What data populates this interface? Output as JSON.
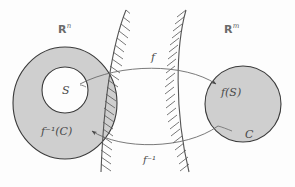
{
  "figure": {
    "background_color": "#fdfdfd"
  },
  "colors": {
    "region_fill": "#cfcfcf",
    "region_stroke": "#3a3a3a",
    "hatch_stroke": "#5a5a5a",
    "arrow_stroke": "#6b6b6b",
    "label_color": "#4a4a4a",
    "space_label_color": "#6a6a6a",
    "inner_hole_fill": "#ffffff"
  },
  "labels": {
    "domain_space": {
      "symbol": "R",
      "superscript": "n",
      "text": "ℝⁿ"
    },
    "codomain_space": {
      "symbol": "R",
      "superscript": "m",
      "text": "ℝᵐ"
    },
    "set_s": "S",
    "set_c": "C",
    "image_of_s": {
      "base": "f",
      "arg": "(S)",
      "text": "f(S)"
    },
    "preimage_of_c": {
      "base": "f",
      "superscript": "−1",
      "arg": "(C)",
      "text": "f⁻¹(C)"
    },
    "map_forward": "f",
    "map_inverse": {
      "base": "f",
      "superscript": "−1",
      "text": "f⁻¹"
    }
  },
  "elements": {
    "left_annulus": {
      "name": "left region annulus",
      "outer_radius": 52,
      "inner_radius": 23,
      "center": [
        65,
        103
      ],
      "fill": "#cfcfcf",
      "description": "shaded annulus representing f inverse of C inside R^n"
    },
    "left_hole": {
      "name": "inner white disc labelled S",
      "radius": 23,
      "center": [
        65,
        90
      ],
      "fill": "#ffffff"
    },
    "right_disc": {
      "name": "right shaded disc",
      "radius": 38,
      "center": [
        243,
        104
      ],
      "fill": "#cfcfcf",
      "description": "shaded disc containing f(S) and C in R^m"
    },
    "left_boundary_curve": {
      "name": "hatched boundary of domain",
      "hatch_side": "right"
    },
    "right_boundary_curve": {
      "name": "hatched boundary of codomain",
      "hatch_side": "left"
    },
    "forward_arrow": {
      "name": "arrow for f",
      "from": "S",
      "to": "f(S)",
      "direction": "left-to-right"
    },
    "inverse_arrow": {
      "name": "arrow for f inverse",
      "from": "C",
      "to": "f^-1(C)",
      "direction": "right-to-left"
    }
  }
}
